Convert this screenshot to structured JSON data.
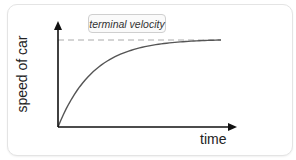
{
  "chart_data": {
    "type": "line",
    "title": "",
    "xlabel": "time",
    "ylabel": "speed of car",
    "annotation": "terminal velocity",
    "terminal_velocity_level": 1.0,
    "x_range": [
      0,
      1
    ],
    "y_range": [
      0,
      1.15
    ],
    "grid": false,
    "legend": "none",
    "series": [
      {
        "name": "speed",
        "curve": "asymptotic rise to terminal velocity",
        "x": [
          0,
          0.1,
          0.2,
          0.3,
          0.4,
          0.5,
          0.6,
          0.7,
          0.8,
          0.9,
          1.0
        ],
        "y": [
          0,
          0.3,
          0.53,
          0.7,
          0.82,
          0.9,
          0.95,
          0.98,
          0.995,
          1.0,
          1.0
        ]
      }
    ],
    "colors": {
      "axis": "#111111",
      "curve": "#555555",
      "dashed_line": "#aaaaaa"
    }
  }
}
